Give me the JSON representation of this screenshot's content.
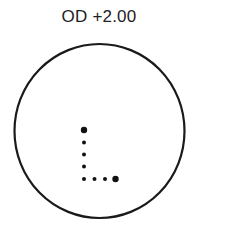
{
  "title": "OD +2.00",
  "diagram": {
    "circle": {
      "cx": 99.5,
      "cy": 131,
      "rx": 85,
      "ry": 87,
      "stroke": "#1a1a1a",
      "stroke_width": 2.2
    },
    "dots": [
      {
        "x": 84,
        "y": 130,
        "r": 3.2
      },
      {
        "x": 84,
        "y": 142.5,
        "r": 2
      },
      {
        "x": 84,
        "y": 154.5,
        "r": 2
      },
      {
        "x": 84,
        "y": 166.5,
        "r": 2
      },
      {
        "x": 84,
        "y": 179,
        "r": 2
      },
      {
        "x": 94.5,
        "y": 179,
        "r": 2
      },
      {
        "x": 105,
        "y": 179,
        "r": 2
      },
      {
        "x": 115.5,
        "y": 179,
        "r": 3.2
      }
    ],
    "dot_color": "#111111"
  }
}
